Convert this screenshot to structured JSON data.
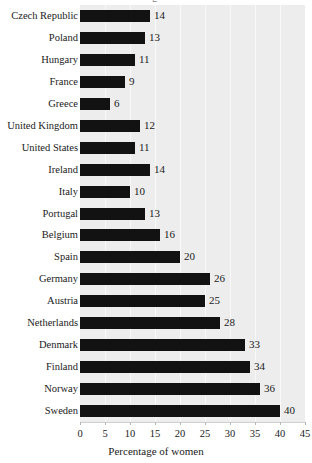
{
  "chart_data": {
    "type": "bar",
    "orientation": "horizontal",
    "title": "",
    "xlabel": "Percentage of women",
    "ylabel": "",
    "xlim": [
      0,
      45
    ],
    "xticks": [
      0,
      5,
      10,
      15,
      20,
      25,
      30,
      35,
      40,
      45
    ],
    "grid": true,
    "grid_axis": "x",
    "legend": false,
    "bar_color": "#121212",
    "plot_background": "#ededed",
    "gridline_color": "#f8f8f8",
    "value_labels": true,
    "categories": [
      "Czech Republic",
      "Poland",
      "Hungary",
      "France",
      "Greece",
      "United Kingdom",
      "United States",
      "Ireland",
      "Italy",
      "Portugal",
      "Belgium",
      "Spain",
      "Germany",
      "Austria",
      "Netherlands",
      "Denmark",
      "Finland",
      "Norway",
      "Sweden"
    ],
    "values": [
      14,
      13,
      11,
      9,
      6,
      12,
      11,
      14,
      10,
      13,
      16,
      20,
      26,
      25,
      28,
      33,
      34,
      36,
      40
    ],
    "title_clipped_glyph": "g"
  }
}
